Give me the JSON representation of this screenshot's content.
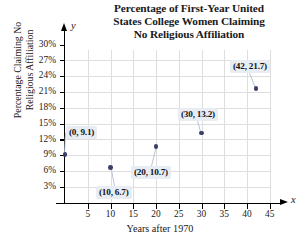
{
  "chart_data": {
    "type": "scatter",
    "title": "Percentage of First-Year United States College Women Claiming No Religious Affiliation",
    "title_lines": [
      "Percentage of First-Year United",
      "States College Women Claiming",
      "No Religious Affiliation"
    ],
    "xlabel": "Years after 1970",
    "ylabel": "Percentage Claiming No Religious Affiliation",
    "ylabel_lines": [
      "Percentage Claiming No",
      "Religious Affiliation"
    ],
    "x_axis_letter": "x",
    "y_axis_letter": "y",
    "xlim": [
      0,
      48
    ],
    "ylim": [
      0,
      31.5
    ],
    "xticks": [
      5,
      10,
      15,
      20,
      25,
      30,
      35,
      40,
      45
    ],
    "xtick_labels": [
      "5",
      "10",
      "15",
      "20",
      "25",
      "30",
      "35",
      "40",
      "45"
    ],
    "yticks": [
      3,
      6,
      9,
      12,
      15,
      18,
      21,
      24,
      27,
      30
    ],
    "ytick_labels": [
      "3%",
      "6%",
      "9%",
      "12%",
      "15%",
      "18%",
      "21%",
      "24%",
      "27%",
      "30%"
    ],
    "grid": true,
    "legend": "none",
    "x": [
      0,
      10,
      20,
      30,
      42
    ],
    "y": [
      9.1,
      6.7,
      10.7,
      13.2,
      21.7
    ],
    "point_labels": [
      "(0, 9.1)",
      "(10, 6.7)",
      "(20, 10.7)",
      "(30, 13.2)",
      "(42, 21.7)"
    ],
    "colors": {
      "point": "#3b3f6b",
      "callout_bg": "#e8edf3",
      "grid": "#dedede",
      "axis": "#000000",
      "leader": "#b9c6d6"
    }
  }
}
